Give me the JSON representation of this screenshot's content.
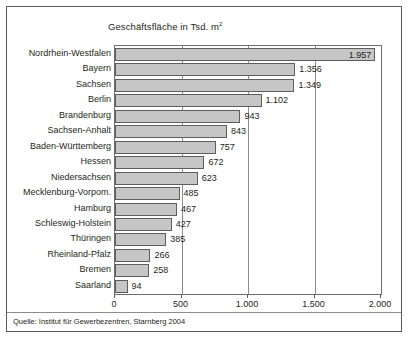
{
  "chart_data": {
    "type": "bar",
    "orientation": "horizontal",
    "title": "Geschäftsfläche in Tsd. m",
    "title_superscript": "2",
    "xlabel": "",
    "ylabel": "",
    "xlim": [
      0,
      2000
    ],
    "xticks": [
      0,
      500,
      1000,
      1500,
      2000
    ],
    "xtick_labels": [
      "0",
      "500",
      "1.000",
      "1.500",
      "2.000"
    ],
    "grid": true,
    "grid_axis": "x",
    "legend": false,
    "categories": [
      "Nordrhein-Westfalen",
      "Bayern",
      "Sachsen",
      "Berlin",
      "Brandenburg",
      "Sachsen-Anhalt",
      "Baden-Württemberg",
      "Hessen",
      "Niedersachsen",
      "Mecklenburg-Vorpom.",
      "Hamburg",
      "Schleswig-Holstein",
      "Thüringen",
      "Rheinland-Pfalz",
      "Bremen",
      "Saarland"
    ],
    "values": [
      1957,
      1356,
      1349,
      1102,
      943,
      843,
      757,
      672,
      623,
      485,
      467,
      427,
      385,
      266,
      258,
      94
    ],
    "value_labels": [
      "1.957",
      "1.356",
      "1.349",
      "1.102",
      "943",
      "843",
      "757",
      "672",
      "623",
      "485",
      "467",
      "427",
      "385",
      "266",
      "258",
      "94"
    ],
    "label_placement": [
      "inside",
      "outside",
      "outside",
      "outside",
      "outside",
      "outside",
      "outside",
      "outside",
      "outside",
      "outside",
      "outside",
      "outside",
      "outside",
      "outside",
      "outside",
      "outside"
    ],
    "bar_fill_color": "#c6c6c6",
    "bar_border_color": "#5d5d5d",
    "axis_color": "#6d6d6d",
    "grid_color": "#8d8d8d",
    "text_color": "#231f20",
    "background_color": "#ffffff"
  },
  "source": {
    "note": "Quelle: Institut für Gewerbezentren, Starnberg 2004"
  }
}
